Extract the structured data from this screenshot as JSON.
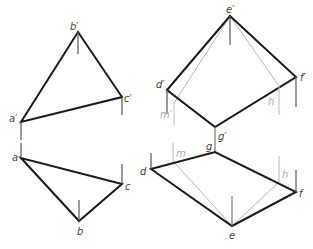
{
  "figure": {
    "colors": {
      "edge": "#1a1a1a",
      "projector": "#555555",
      "construction": "#b8b8b8",
      "label": "#444444",
      "label_gray": "#aaaaaa"
    }
  },
  "triangle": {
    "front_view": {
      "labels": {
        "a": "a′",
        "b": "b′",
        "c": "c′"
      },
      "points": {
        "a": [
          21,
          122
        ],
        "b": [
          78,
          32
        ],
        "c": [
          122,
          97
        ]
      }
    },
    "top_view": {
      "labels": {
        "a": "a",
        "b": "b",
        "c": "c"
      },
      "points": {
        "a": [
          21,
          158
        ],
        "b": [
          79,
          221
        ],
        "c": [
          122,
          184
        ]
      }
    }
  },
  "quadrilateral": {
    "front_view": {
      "labels": {
        "d": "d′",
        "e": "e′",
        "f": "f′",
        "g": "g′",
        "m": "m′",
        "h": "h′"
      },
      "points": {
        "d": [
          167,
          90
        ],
        "e": [
          230,
          16
        ],
        "f": [
          296,
          77
        ],
        "g": [
          215,
          127
        ],
        "m": [
          174,
          103
        ],
        "h": [
          279,
          86
        ]
      }
    },
    "top_view": {
      "labels": {
        "d": "d",
        "e": "e",
        "f": "f",
        "g": "g",
        "m": "m",
        "h": "h"
      },
      "points": {
        "d": [
          151,
          169
        ],
        "e": [
          232,
          226
        ],
        "f": [
          296,
          192
        ],
        "g": [
          215,
          152
        ],
        "m": [
          173,
          161
        ],
        "h": [
          279,
          182
        ]
      }
    }
  }
}
